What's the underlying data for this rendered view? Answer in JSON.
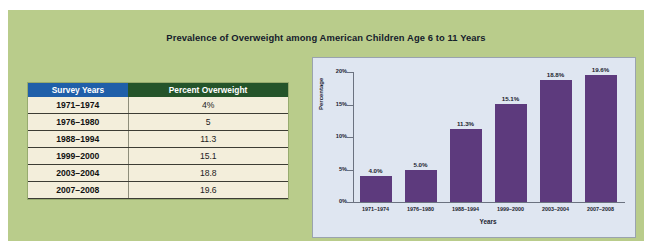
{
  "slide": {
    "title": "Prevalence of Overweight among American Children Age 6 to 11 Years",
    "background_color": "#b9cc8b"
  },
  "table": {
    "headers": [
      "Survey Years",
      "Percent Overweight"
    ],
    "header_colors": [
      "#1f5fa9",
      "#24542a"
    ],
    "body_color": "#f3eedb",
    "rows": [
      {
        "years": "1971–1974",
        "percent": "4%"
      },
      {
        "years": "1976–1980",
        "percent": "5"
      },
      {
        "years": "1988–1994",
        "percent": "11.3"
      },
      {
        "years": "1999–2000",
        "percent": "15.1"
      },
      {
        "years": "2003–2004",
        "percent": "18.8"
      },
      {
        "years": "2007–2008",
        "percent": "19.6"
      }
    ]
  },
  "chart_panel": {
    "background_color": "#dfe6f1",
    "border_color": "#9aa3ae",
    "bar_color": "#5d3a7d"
  },
  "chart_data": {
    "type": "bar",
    "title": "",
    "xlabel": "Years",
    "ylabel": "Percentage",
    "ylim": [
      0,
      20
    ],
    "grid": false,
    "legend": "none",
    "categories": [
      "1971–1974",
      "1976–1980",
      "1988–1994",
      "1999–2000",
      "2003–2004",
      "2007–2008"
    ],
    "values": [
      4.0,
      5.0,
      11.3,
      15.1,
      18.8,
      19.6
    ],
    "data_labels": [
      "4.0%",
      "5.0%",
      "11.3%",
      "15.1%",
      "18.8%",
      "19.6%"
    ],
    "ytick_values": [
      0,
      5,
      10,
      15,
      20
    ],
    "ytick_labels": [
      "0%",
      "5%",
      "10%",
      "15%",
      "20%"
    ]
  }
}
